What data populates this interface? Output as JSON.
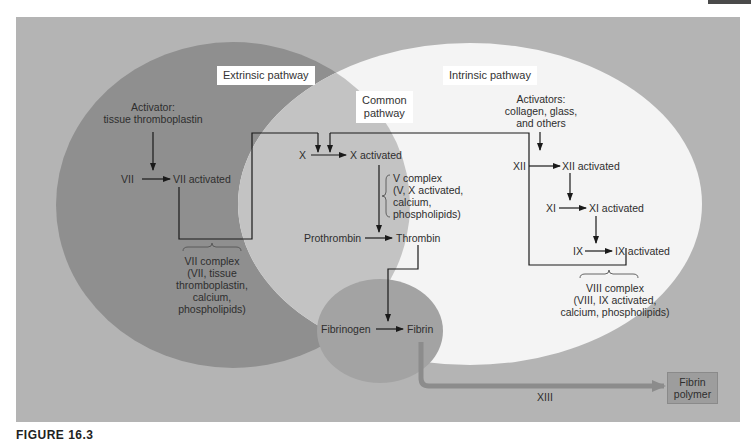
{
  "diagram": {
    "colors": {
      "background_panel": "#b4b4b4",
      "extrinsic_region": "#8f8f8f",
      "intrinsic_region": "#f4f4f4",
      "common_overlap": "#c3c3c3",
      "fibrin_region": "#a3a3a3",
      "arrow_line": "#1a1a1a",
      "xiii_arrow": "#8c8c8c",
      "label_box": "#ffffff"
    },
    "regions": {
      "extrinsic": {
        "label": "Extrinsic pathway"
      },
      "common": {
        "label_line1": "Common",
        "label_line2": "pathway"
      },
      "intrinsic": {
        "label": "Intrinsic pathway"
      }
    },
    "extrinsic": {
      "activator_line1": "Activator:",
      "activator_line2": "tissue thromboplastin",
      "factor": "VII",
      "factor_activated": "VII activated",
      "complex": [
        "VII complex",
        "(VII, tissue",
        "thromboplastin,",
        "calcium,",
        "phospholipids)"
      ]
    },
    "common": {
      "factor_x": "X",
      "factor_x_activated": "X activated",
      "v_complex": [
        "V complex",
        "(V, X activated,",
        "calcium,",
        "phospholipids)"
      ],
      "prothrombin": "Prothrombin",
      "thrombin": "Thrombin",
      "fibrinogen": "Fibrinogen",
      "fibrin": "Fibrin"
    },
    "intrinsic": {
      "activators": [
        "Activators:",
        "collagen, glass,",
        "and others"
      ],
      "xii": "XII",
      "xii_activated": "XII activated",
      "xi": "XI",
      "xi_activated": "XI activated",
      "ix": "IX",
      "ix_activated": "IX activated",
      "complex": [
        "VIII complex",
        "(VIII, IX activated,",
        "calcium, phospholipids)"
      ]
    },
    "polymerization": {
      "enzyme": "XIII",
      "product_line1": "Fibrin",
      "product_line2": "polymer"
    },
    "caption": "FIGURE 16.3"
  }
}
